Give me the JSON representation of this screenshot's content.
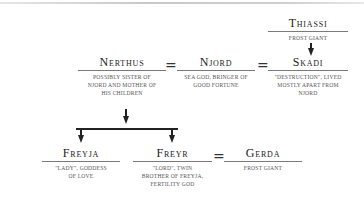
{
  "figure": {
    "type": "family-tree",
    "persons": [
      {
        "id": "thiassi",
        "name": "Thiassi",
        "description": "Frost giant"
      },
      {
        "id": "nerthus",
        "name": "Nerthus",
        "description": "Possibly sister of Njord and mother of his children"
      },
      {
        "id": "njord",
        "name": "Njord",
        "description": "Sea god, bringer of good fortune"
      },
      {
        "id": "skadi",
        "name": "Skadi",
        "description": "\"Destruction\", lived mostly apart from Njord"
      },
      {
        "id": "freyja",
        "name": "Freyja",
        "description": "\"Lady\", goddess of love"
      },
      {
        "id": "freyr",
        "name": "Freyr",
        "description": "\"Lord\", twin brother of Freyja, fertility god"
      },
      {
        "id": "gerda",
        "name": "Gerda",
        "description": "Frost giant"
      }
    ],
    "marriage_symbol": "=",
    "relations": [
      {
        "type": "marriage",
        "a": "nerthus",
        "b": "njord"
      },
      {
        "type": "marriage",
        "a": "njord",
        "b": "skadi"
      },
      {
        "type": "marriage",
        "a": "freyr",
        "b": "gerda"
      },
      {
        "type": "parent-child",
        "parent": "thiassi",
        "child": "skadi"
      },
      {
        "type": "parent-child",
        "parent": "nerthus",
        "child": "freyja"
      },
      {
        "type": "parent-child",
        "parent": "nerthus",
        "child": "freyr"
      }
    ]
  }
}
